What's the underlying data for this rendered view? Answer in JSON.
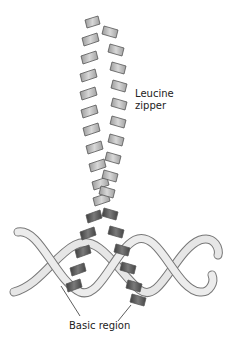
{
  "diagram": {
    "labels": {
      "zipper_line1": "Leucine",
      "zipper_line2": "zipper",
      "basic": "Basic region"
    },
    "colors": {
      "helix_light": "#c8c8c8",
      "helix_dark": "#5a5a5a",
      "dna": "#e0e0e0",
      "outline": "#666666",
      "text": "#222222"
    }
  }
}
